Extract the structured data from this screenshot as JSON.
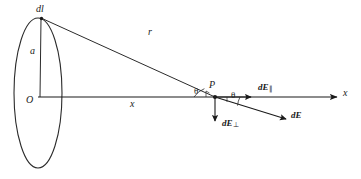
{
  "figure": {
    "width": 361,
    "height": 179,
    "background": "#ffffff",
    "stroke_color": "#1a1a1a",
    "text_color": "#1a1a1a"
  },
  "labels": {
    "charge_element": "d",
    "charge_element_italic": "l",
    "ring_radius": "a",
    "ring_center": "O",
    "distance_r": "r",
    "axial_distance": "x",
    "field_point": "P",
    "angle_left": "θ",
    "angle_right": "θ",
    "axis_x": "x",
    "field_parallel_base": "dE",
    "field_parallel_sub": "∥",
    "field_perp_base": "dE",
    "field_perp_sub": "⊥",
    "field_total": "dE"
  },
  "geometry": {
    "ring": {
      "center_x": 38,
      "center_y": 93,
      "semi_axis_x": 24,
      "semi_axis_y": 75,
      "top_point_x": 41,
      "top_point_y": 18
    },
    "point_P": {
      "x": 215,
      "y": 97
    },
    "axis_start": {
      "x": 38,
      "y": 97
    },
    "axis_end": {
      "x": 341,
      "y": 97
    },
    "r_line": {
      "x1": 41,
      "y1": 18,
      "x2": 215,
      "y2": 97
    },
    "dE_vector_end": {
      "x": 289,
      "y": 121
    },
    "dE_perp_end": {
      "x": 215,
      "y": 126
    },
    "dE_par_end": {
      "x": 255,
      "y": 97
    }
  }
}
